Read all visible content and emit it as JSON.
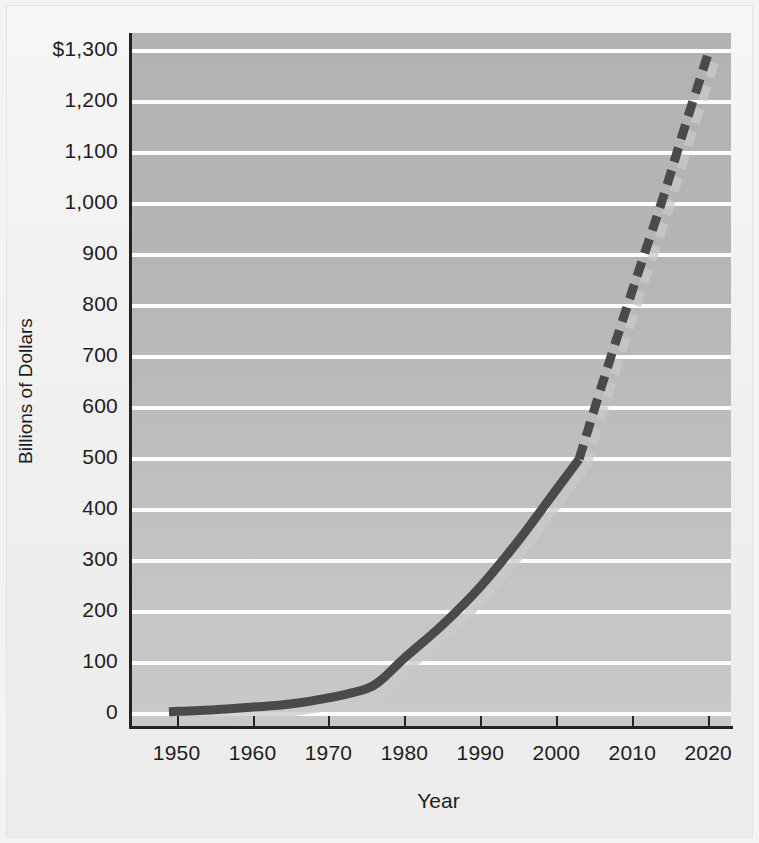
{
  "figure": {
    "kind": "line-chart-scan",
    "background_color": "#f3f3f3",
    "plot_background_color": "#b2b2b2",
    "gridline_color": "#fdfdfd",
    "axis_color": "#232323"
  },
  "axes": {
    "y_title": "Billions of Dollars",
    "x_title": "Year",
    "y_tick_labels": [
      "$1,300",
      "1,200",
      "1,100",
      "1,000",
      "900",
      "800",
      "700",
      "600",
      "500",
      "400",
      "300",
      "200",
      "100",
      "0"
    ],
    "x_tick_labels": [
      "1950",
      "1960",
      "1970",
      "1980",
      "1990",
      "2000",
      "2010",
      "2020"
    ]
  },
  "chart_data": {
    "type": "line",
    "title": "",
    "subtitle": "",
    "xlabel": "Year",
    "ylabel": "Billions of Dollars",
    "xlim": [
      1944,
      2023
    ],
    "ylim": [
      -25,
      1335
    ],
    "xticks": [
      1950,
      1960,
      1970,
      1980,
      1990,
      2000,
      2010,
      2020
    ],
    "yticks": [
      0,
      100,
      200,
      300,
      400,
      500,
      600,
      700,
      800,
      900,
      1000,
      1100,
      1200,
      1300
    ],
    "ytick_labels": [
      "0",
      "100",
      "200",
      "300",
      "400",
      "500",
      "600",
      "700",
      "800",
      "900",
      "1,000",
      "1,100",
      "1,200",
      "$1,300"
    ],
    "grid": "horizontal",
    "legend": "none",
    "annotations": [],
    "series": [
      {
        "name": "Actual and projected spending",
        "color": "#4a4a4a",
        "shadow_color": "#c9c9c9",
        "line_width": 9,
        "style_actual": "solid",
        "style_projected": "dashed",
        "projection_start_year": 2003,
        "x": [
          1949,
          1955,
          1960,
          1965,
          1970,
          1975,
          1977,
          1980,
          1985,
          1990,
          1995,
          2000,
          2003,
          2006,
          2010,
          2014,
          2017,
          2020
        ],
        "y": [
          5,
          9,
          14,
          20,
          32,
          50,
          68,
          110,
          175,
          250,
          340,
          440,
          500,
          645,
          830,
          1010,
          1155,
          1295
        ]
      }
    ]
  }
}
